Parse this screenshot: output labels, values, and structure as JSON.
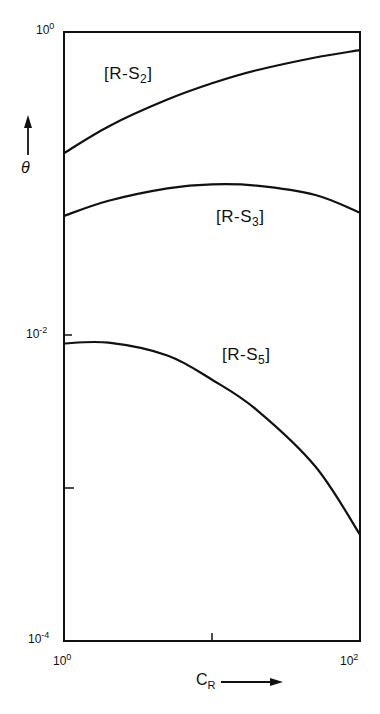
{
  "chart_data": {
    "type": "line",
    "title": "",
    "xlabel": "C_R",
    "ylabel": "θ",
    "xscale": "log",
    "yscale": "log",
    "xlim": [
      1,
      100
    ],
    "ylim": [
      0.0001,
      1
    ],
    "x_ticks": [
      "10^0",
      "10^1",
      "10^2"
    ],
    "x_tick_labels": [
      {
        "base": "10",
        "exp": "0"
      },
      {
        "base": "10",
        "exp": "2"
      }
    ],
    "y_tick_labels": [
      {
        "base": "10",
        "exp": "0"
      },
      {
        "base": "10",
        "exp": "-2"
      },
      {
        "base": "10",
        "exp": "-4"
      }
    ],
    "grid": false,
    "legend": "inline labels",
    "series": [
      {
        "name": "[R-S2]",
        "label_main": "[R-S",
        "label_sub": "2",
        "x": [
          1,
          2,
          5,
          10,
          20,
          50,
          100
        ],
        "values": [
          0.16,
          0.24,
          0.36,
          0.46,
          0.56,
          0.68,
          0.76
        ]
      },
      {
        "name": "[R-S3]",
        "label_main": "[R-S",
        "label_sub": "3",
        "x": [
          1,
          2,
          5,
          10,
          20,
          50,
          100
        ],
        "values": [
          0.062,
          0.078,
          0.094,
          0.1,
          0.098,
          0.085,
          0.065
        ]
      },
      {
        "name": "[R-S5]",
        "label_main": "[R-S",
        "label_sub": "5",
        "x": [
          1,
          2,
          5,
          10,
          20,
          50,
          100
        ],
        "values": [
          0.009,
          0.0091,
          0.0075,
          0.0052,
          0.0033,
          0.0014,
          0.0005
        ]
      }
    ]
  },
  "axes": {
    "y_label": "θ",
    "x_label_main": "C",
    "x_label_sub": "R"
  }
}
